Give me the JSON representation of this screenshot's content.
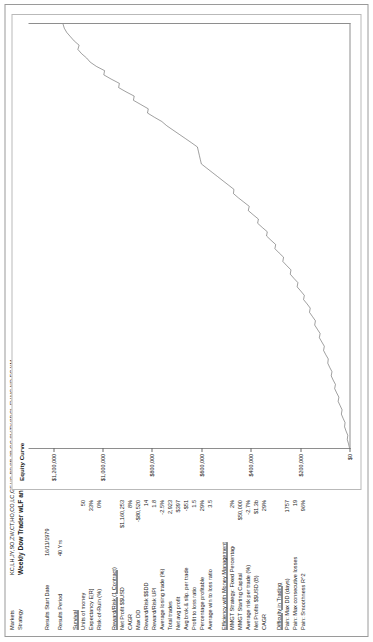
{
  "header": {
    "markets_label": "Markets",
    "markets_value": "KC,LH,JY,SO,ZW,CT,HO,CO,LC,GF,HG,BP,SB,2B,GC,SV,TY,SP,CL,FV,NG,ND,EC,YM",
    "strategy_label": "Strategy",
    "strategy_value": "Weekly Dow Trader wLF and 2 Stop Trade Plan"
  },
  "meta": [
    {
      "label": "Results Start Date",
      "value": "16/11/1979"
    },
    {
      "label": "Results Period",
      "value": "40 Yrs"
    }
  ],
  "groups": [
    {
      "title": "Survival",
      "rows": [
        {
          "label": "Units of money",
          "value": "50"
        },
        {
          "label": "Expectancy E[R]",
          "value": "33%"
        },
        {
          "label": "Risk-of-Ruin (%)",
          "value": "0%"
        }
      ]
    },
    {
      "title": "Reward/Risk (1 Contract)",
      "rows": [
        {
          "label": "Net Profit $$USD",
          "value": "$1,160,253"
        },
        {
          "label": "CAGR",
          "value": "8%"
        },
        {
          "label": "Max DD",
          "value": "-$80,520"
        },
        {
          "label": "Reward/Risk  $$DD",
          "value": "14"
        },
        {
          "label": "Reward/Risk  UPI",
          "value": "1.8"
        },
        {
          "label": "Average losing trade (%)",
          "value": "-2.5%"
        },
        {
          "label": "Total trades",
          "value": "2,923"
        },
        {
          "label": "Net avg profit",
          "value": "$397"
        },
        {
          "label": "Avg brok.& slip. per trade",
          "value": "-$51"
        },
        {
          "label": "Profit to loss ratio",
          "value": "1.5"
        },
        {
          "label": "Percentage profitable",
          "value": "29%"
        },
        {
          "label": "Average win to loss ratio",
          "value": "3.5"
        }
      ]
    },
    {
      "title": "Efficiency with Money Management",
      "rows": [
        {
          "label": "MMGT Strategy:  Fixed Percentage",
          "value": "2%"
        },
        {
          "label": "MMGT Starting Capital",
          "value": "$50,000"
        },
        {
          "label": "Average risk per trade (%)",
          "value": "-2.7%"
        },
        {
          "label": "Net Profits $$USD (B)",
          "value": "$1.3b"
        },
        {
          "label": "CAGR",
          "value": "29%"
        }
      ]
    },
    {
      "title": "Difficulty in Trading",
      "rows": [
        {
          "label": "Pain: Max DD (days)",
          "value": "1757"
        },
        {
          "label": "Pain: Max consecutive losses",
          "value": "19"
        },
        {
          "label": "Pain: Smoothness R^2",
          "value": "96%"
        }
      ]
    }
  ],
  "chart_data": {
    "type": "line",
    "title": "Equity Curve",
    "xlabel": "",
    "ylabel": "",
    "grid": false,
    "legend": "none",
    "ylim": [
      0,
      1300000
    ],
    "ytick_labels": [
      "$1,200,000",
      "$1,000,000",
      "$800,000",
      "$600,000",
      "$400,000",
      "$200,000",
      "$0"
    ],
    "ytick_values": [
      1200000,
      1000000,
      800000,
      600000,
      400000,
      200000,
      0
    ],
    "series": [
      {
        "name": "Equity Curve",
        "x": [
          0,
          1,
          2,
          3,
          4,
          5,
          6,
          7,
          8,
          9,
          10,
          11,
          12,
          13,
          14,
          15,
          16,
          17,
          18,
          19,
          20,
          21,
          22,
          23,
          24,
          25,
          26,
          27,
          28,
          29,
          30,
          31,
          32,
          33,
          34,
          35,
          36,
          37,
          38,
          39,
          40,
          41,
          42,
          43,
          44,
          45,
          46,
          47,
          48,
          49,
          50,
          51,
          52,
          53,
          54,
          55,
          56,
          57,
          58,
          59,
          60,
          61,
          62,
          63,
          64,
          65,
          66,
          67,
          68,
          69,
          70,
          71,
          72,
          73,
          74,
          75,
          76,
          77,
          78,
          79,
          80,
          81,
          82,
          83,
          84,
          85,
          86,
          87,
          88,
          89,
          90,
          91,
          92,
          93,
          94,
          95,
          96,
          97,
          98,
          99,
          100
        ],
        "values": [
          0,
          4000,
          9000,
          7000,
          14000,
          20000,
          18000,
          26000,
          33000,
          30000,
          38000,
          46000,
          43000,
          52000,
          60000,
          57000,
          66000,
          74000,
          71000,
          80000,
          88000,
          86000,
          96000,
          105000,
          102000,
          112000,
          122000,
          119000,
          130000,
          141000,
          138000,
          150000,
          162000,
          159000,
          172000,
          186000,
          183000,
          197000,
          212000,
          209000,
          225000,
          240000,
          237000,
          254000,
          270000,
          267000,
          285000,
          302000,
          299000,
          318000,
          336000,
          333000,
          353000,
          372000,
          369000,
          390000,
          410000,
          406000,
          428000,
          450000,
          470000,
          468000,
          490000,
          512000,
          534000,
          556000,
          578000,
          600000,
          604000,
          608000,
          612000,
          616000,
          640000,
          665000,
          690000,
          715000,
          740000,
          760000,
          790000,
          818000,
          815000,
          845000,
          875000,
          872000,
          905000,
          935000,
          932000,
          965000,
          995000,
          992000,
          1025000,
          1050000,
          1065000,
          1085000,
          1100000,
          1095000,
          1115000,
          1130000,
          1145000,
          1155000,
          1160253
        ]
      }
    ]
  }
}
